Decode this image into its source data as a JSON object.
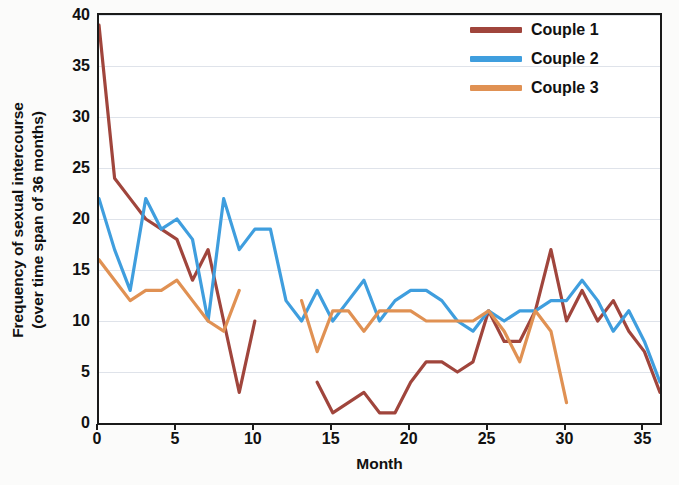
{
  "chart_data": {
    "type": "line",
    "title": "",
    "xlabel": "Month",
    "ylabel": "Frequency of sexual intercourse (over time span of 36 months)",
    "ylabel_line1": "Frequency of sexual intercourse",
    "ylabel_line2": "(over time span of 36 months)",
    "xlim": [
      0,
      36
    ],
    "ylim": [
      0,
      40
    ],
    "xticks": [
      0,
      5,
      10,
      15,
      20,
      25,
      30,
      35
    ],
    "yticks": [
      0,
      5,
      10,
      15,
      20,
      25,
      30,
      35,
      40
    ],
    "grid": true,
    "grid_axis": "y",
    "legend_position": "top-right",
    "series": [
      {
        "name": "Couple 1",
        "color": "#a0453c",
        "x": [
          0,
          1,
          2,
          3,
          4,
          5,
          6,
          7,
          8,
          9,
          10,
          14,
          15,
          16,
          17,
          18,
          19,
          20,
          21,
          22,
          23,
          24,
          25,
          26,
          27,
          28,
          29,
          30,
          31,
          32,
          33,
          34,
          35,
          36
        ],
        "values": [
          39,
          24,
          22,
          20,
          19,
          18,
          14,
          17,
          10,
          3,
          10,
          4,
          1,
          2,
          3,
          1,
          1,
          4,
          6,
          6,
          5,
          6,
          11,
          8,
          8,
          11,
          17,
          10,
          13,
          10,
          12,
          9,
          7,
          3
        ],
        "gaps": [
          [
            10,
            14
          ]
        ]
      },
      {
        "name": "Couple 2",
        "color": "#3f9ede",
        "x": [
          0,
          1,
          2,
          3,
          4,
          5,
          6,
          7,
          8,
          9,
          10,
          11,
          12,
          13,
          14,
          15,
          16,
          17,
          18,
          19,
          20,
          21,
          22,
          23,
          24,
          25,
          26,
          27,
          28,
          29,
          30,
          31,
          32,
          33,
          34,
          35,
          36
        ],
        "values": [
          22,
          17,
          13,
          22,
          19,
          20,
          18,
          10,
          22,
          17,
          19,
          19,
          12,
          10,
          13,
          10,
          12,
          14,
          10,
          12,
          13,
          13,
          12,
          10,
          9,
          11,
          10,
          11,
          11,
          12,
          12,
          14,
          12,
          9,
          11,
          8,
          4
        ],
        "gaps": []
      },
      {
        "name": "Couple 3",
        "color": "#e09153",
        "x": [
          0,
          1,
          2,
          3,
          4,
          5,
          6,
          7,
          8,
          9,
          13,
          14,
          15,
          16,
          17,
          18,
          19,
          20,
          21,
          22,
          23,
          24,
          25,
          26,
          27,
          28,
          29,
          30
        ],
        "values": [
          16,
          14,
          12,
          13,
          13,
          14,
          12,
          10,
          9,
          13,
          12,
          7,
          11,
          11,
          9,
          11,
          11,
          11,
          10,
          10,
          10,
          10,
          11,
          9,
          6,
          11,
          9,
          2
        ],
        "gaps": [
          [
            9,
            13
          ]
        ]
      }
    ]
  },
  "legend": {
    "items": [
      {
        "label": "Couple 1",
        "color": "#a0453c"
      },
      {
        "label": "Couple 2",
        "color": "#3f9ede"
      },
      {
        "label": "Couple 3",
        "color": "#e09153"
      }
    ]
  }
}
